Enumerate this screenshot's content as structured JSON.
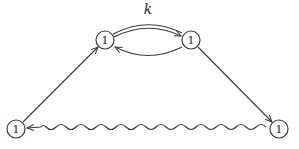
{
  "diagram": {
    "type": "feynman-like directed graph",
    "nodes": [
      {
        "id": "top-left",
        "label": "1",
        "x": 105,
        "y": 40
      },
      {
        "id": "top-right",
        "label": "1",
        "x": 191,
        "y": 40
      },
      {
        "id": "bottom-left",
        "label": "1",
        "x": 16,
        "y": 129
      },
      {
        "id": "bottom-right",
        "label": "1",
        "x": 279,
        "y": 129
      }
    ],
    "edges": [
      {
        "from": "top-left",
        "to": "top-right",
        "style": "double-arc",
        "label": "k"
      },
      {
        "from": "top-right",
        "to": "top-left",
        "style": "arc"
      },
      {
        "from": "top-right",
        "to": "bottom-right",
        "style": "straight"
      },
      {
        "from": "bottom-right",
        "to": "bottom-left",
        "style": "wavy"
      },
      {
        "from": "bottom-left",
        "to": "top-left",
        "style": "straight"
      }
    ],
    "edge_label": "k"
  }
}
